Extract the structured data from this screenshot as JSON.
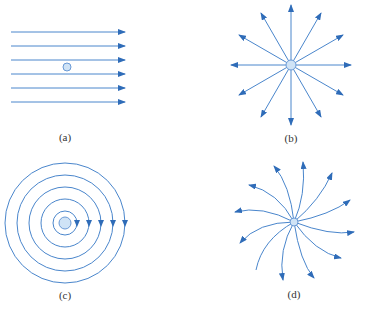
{
  "colors": {
    "line": "#4a86cc",
    "arrow": "#2f6cb8",
    "fill": "#cfe3f6",
    "stroke": "#6a9ad6"
  },
  "panels": [
    {
      "id": "a",
      "label": "(a)",
      "type": "uniform-field",
      "lines": 6
    },
    {
      "id": "b",
      "label": "(b)",
      "type": "radial-field",
      "spokes": 12
    },
    {
      "id": "c",
      "label": "(c)",
      "type": "circular-field",
      "rings": 5
    },
    {
      "id": "d",
      "label": "(d)",
      "type": "spiral-field",
      "arms": 12
    }
  ]
}
